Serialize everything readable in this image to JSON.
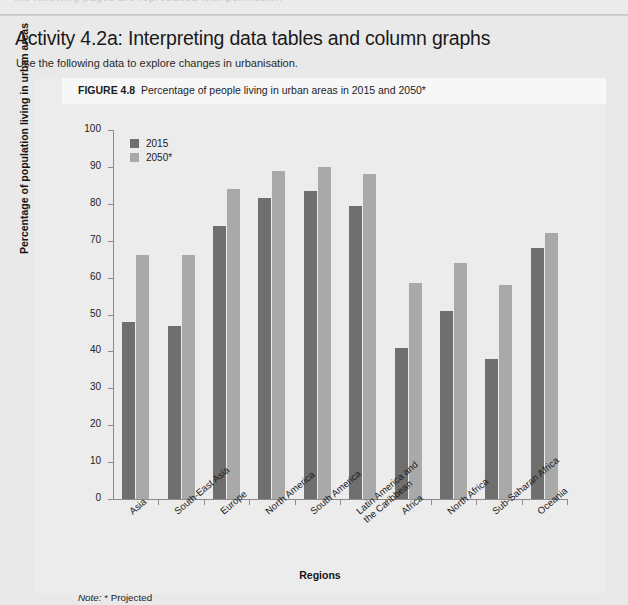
{
  "page": {
    "top_ghost_text": "the following pages are reproduced with permission",
    "title": "Activity 4.2a: Interpreting data tables and column graphs",
    "subtitle": "Use the following data to explore changes in urbanisation."
  },
  "figure": {
    "number_label": "FIGURE 4.8",
    "caption": "Percentage of people living in urban areas in 2015 and 2050*",
    "note_word": "Note:",
    "note_text": "* Projected"
  },
  "legend": {
    "items": [
      {
        "label": "2015",
        "color": "#6f6f6f"
      },
      {
        "label": "2050*",
        "color": "#a9a9a9"
      }
    ]
  },
  "chart_data": {
    "type": "bar",
    "title": "Percentage of people living in urban areas in 2015 and 2050*",
    "xlabel": "Regions",
    "ylabel": "Percentage of population living in urban areas",
    "ylim": [
      0,
      100
    ],
    "yticks": [
      0,
      10,
      20,
      30,
      40,
      50,
      60,
      70,
      80,
      90,
      100
    ],
    "grid": false,
    "legend_position": "top-left",
    "categories": [
      "Asia",
      "South-East Asia",
      "Europe",
      "North America",
      "South America",
      "Latin America and the Caribbean",
      "Africa",
      "North Africa",
      "Sub-Saharan Africa",
      "Oceania"
    ],
    "category_lines": [
      [
        "Asia"
      ],
      [
        "South-East Asia"
      ],
      [
        "Europe"
      ],
      [
        "North America"
      ],
      [
        "South America"
      ],
      [
        "Latin America and",
        "the Caribbean"
      ],
      [
        "Africa"
      ],
      [
        "North Africa"
      ],
      [
        "Sub-Saharan Africa"
      ],
      [
        "Oceania"
      ]
    ],
    "series": [
      {
        "name": "2015",
        "color": "#6f6f6f",
        "values": [
          48,
          47,
          74,
          81.5,
          83.5,
          79.5,
          41,
          51,
          38,
          68
        ]
      },
      {
        "name": "2050*",
        "color": "#a9a9a9",
        "values": [
          66,
          66,
          84,
          89,
          90,
          88,
          58.5,
          64,
          58,
          72
        ]
      }
    ]
  }
}
